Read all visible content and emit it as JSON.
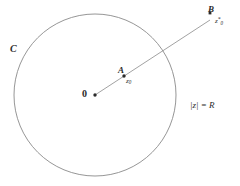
{
  "figure": {
    "background_color": "#ffffff",
    "stroke_color": "#8a8a8a",
    "text_color": "#2b2b2b",
    "circle": {
      "name_label": "C",
      "equation_label": "|z| = R",
      "center_x": 95,
      "center_y": 95,
      "radius": 81
    },
    "origin": {
      "label": "0",
      "x": 95,
      "y": 95
    },
    "point_a": {
      "label": "A",
      "value_base": "z",
      "value_sub": "0",
      "value_sup": "",
      "x": 124,
      "y": 76
    },
    "point_b": {
      "label": "B",
      "value_base": "z",
      "value_sub": "0",
      "value_sup": "*",
      "x": 210,
      "y": 20
    },
    "ray": {
      "from_x": 95,
      "from_y": 95,
      "to_x": 210,
      "to_y": 20
    }
  }
}
